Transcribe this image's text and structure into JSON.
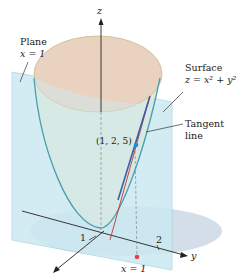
{
  "figure": {
    "labels": {
      "plane_title": "Plane",
      "plane_eq": "x = 1",
      "surface_title": "Surface",
      "surface_eq": "z = x² + y²",
      "tangent_title": "Tangent",
      "tangent_title2": "line",
      "point": "(1, 2, 5)",
      "z_axis": "z",
      "y_axis": "y",
      "x_axis": "x",
      "tick_x": "1",
      "tick_y": "2",
      "foot_label": "x = 1"
    },
    "colors": {
      "surface_top": "#e9d3c0",
      "surface_side": "#dfe8d6",
      "surface_edge": "#4a9eb0",
      "plane": "#cde9f2",
      "plane_edge": "#8cc8d8",
      "base_disk": "#cdd8e4",
      "tangent_line": "#3c5ea8",
      "tangent_line_red": "#c0392b",
      "point": "#1e90d8",
      "foot_point": "#e0404a",
      "axis": "#222222"
    }
  }
}
